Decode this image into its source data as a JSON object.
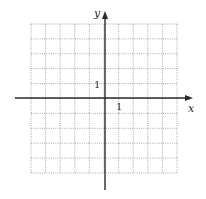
{
  "diagram": {
    "type": "coordinate-grid",
    "x_axis_label": "x",
    "y_axis_label": "y",
    "x_unit_label": "1",
    "y_unit_label": "1",
    "grid": {
      "columns": 10,
      "rows": 10,
      "x_range": [
        -5,
        5
      ],
      "y_range": [
        -5,
        5
      ],
      "line_style": "dotted"
    },
    "colors": {
      "grid": "#a8a8a8",
      "axes": "#2a2a2a",
      "background": "#ffffff"
    }
  }
}
